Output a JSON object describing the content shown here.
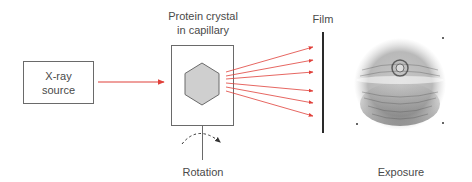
{
  "diagram": {
    "source_label_line1": "X-ray",
    "source_label_line2": "source",
    "crystal_label_line1": "Protein crystal",
    "crystal_label_line2": "in capillary",
    "film_label": "Film",
    "rotation_label": "Rotation",
    "exposure_label": "Exposure"
  },
  "colors": {
    "beam": "#e0403a",
    "box_stroke": "#6a6a6a",
    "crystal_fill": "#cfcfcf",
    "film": "#2a2a2a"
  }
}
